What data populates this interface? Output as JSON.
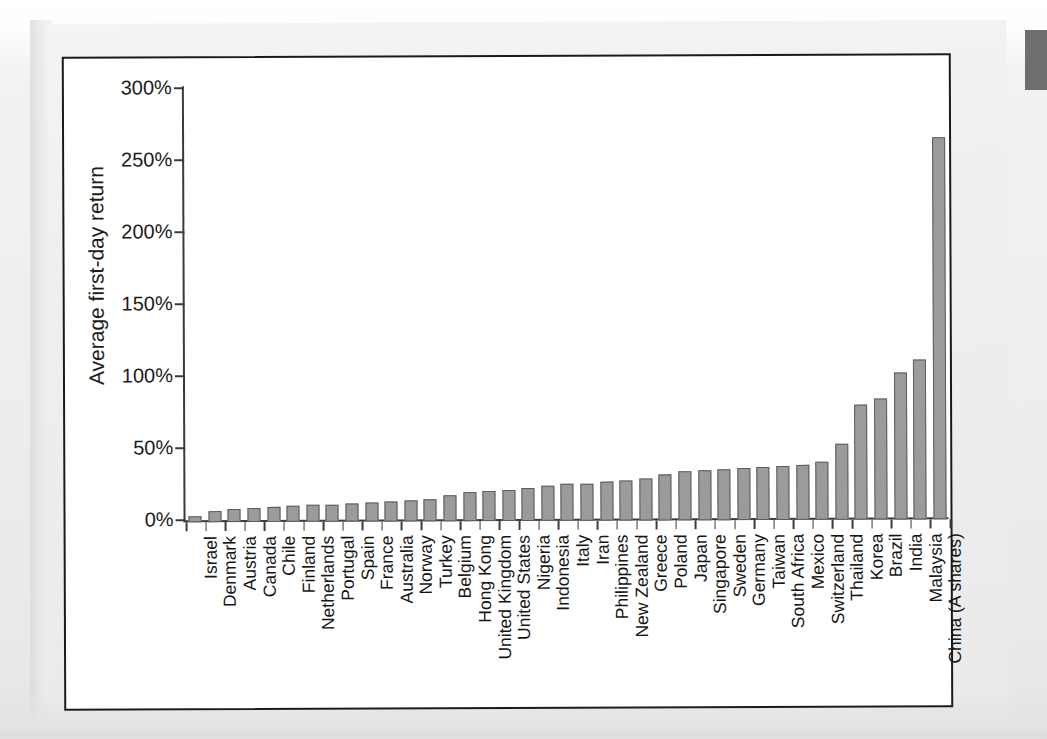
{
  "page": {
    "type": "scanned-book-page",
    "right_tab_color": "#6e6e6e",
    "background_color": "#eeeeee"
  },
  "chart_data": {
    "type": "bar",
    "title": "",
    "xlabel": "",
    "ylabel": "Average first-day return",
    "ylim": [
      0,
      300
    ],
    "ytick_labels": [
      "0%",
      "50%",
      "100%",
      "150%",
      "200%",
      "250%",
      "300%"
    ],
    "ytick_values": [
      0,
      50,
      100,
      150,
      200,
      250,
      300
    ],
    "grid": false,
    "legend": false,
    "bar_color": "#9b9b9b",
    "bar_edge_color": "#5d5d5d",
    "categories": [
      "Israel",
      "Denmark",
      "Austria",
      "Canada",
      "Chile",
      "Finland",
      "Netherlands",
      "Portugal",
      "Spain",
      "France",
      "Australia",
      "Norway",
      "Turkey",
      "Belgium",
      "Hong Kong",
      "United Kingdom",
      "United States",
      "Nigeria",
      "Indonesia",
      "Italy",
      "Iran",
      "Philippines",
      "New Zealand",
      "Greece",
      "Poland",
      "Japan",
      "Singapore",
      "Sweden",
      "Germany",
      "Taiwan",
      "South Africa",
      "Mexico",
      "Switzerland",
      "Thailand",
      "Korea",
      "Brazil",
      "India",
      "Malaysia",
      "China (A shares)"
    ],
    "values": [
      4.5,
      7.5,
      9.0,
      9.5,
      10.5,
      11.0,
      11.5,
      12.0,
      12.5,
      13.0,
      14.0,
      14.5,
      15.5,
      18.0,
      20.0,
      21.0,
      21.5,
      23.0,
      24.5,
      25.5,
      26.0,
      27.0,
      28.0,
      29.5,
      32.0,
      34.0,
      35.0,
      35.5,
      36.0,
      36.5,
      37.5,
      38.0,
      40.5,
      53.0,
      80.0,
      84.0,
      102.0,
      111.0,
      265.0
    ]
  }
}
